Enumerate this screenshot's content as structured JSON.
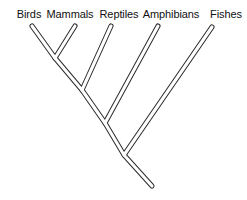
{
  "figure": {
    "name": "cladogram",
    "type": "phylogenetic-tree-diagram",
    "background_color": "#ffffff",
    "line_color": "#2b2b2b",
    "line_fill_color": "#ffffff",
    "label_color": "#111111"
  },
  "taxa": [
    {
      "id": "birds",
      "label": "Birds",
      "label_x": 29,
      "label_y": 8,
      "tip_x": 32,
      "tip_y": 26
    },
    {
      "id": "mammals",
      "label": "Mammals",
      "label_x": 70,
      "label_y": 8,
      "tip_x": 75,
      "tip_y": 26
    },
    {
      "id": "reptiles",
      "label": "Reptiles",
      "label_x": 119,
      "label_y": 8,
      "tip_x": 111,
      "tip_y": 26
    },
    {
      "id": "amphibians",
      "label": "Amphibians",
      "label_x": 171,
      "label_y": 8,
      "tip_x": 158,
      "tip_y": 26
    },
    {
      "id": "fishes",
      "label": "Fishes",
      "label_x": 226,
      "label_y": 8,
      "tip_x": 212,
      "tip_y": 27
    }
  ],
  "nodes": [
    {
      "id": "node-birds-mammals",
      "x": 55,
      "y": 58,
      "children": [
        "birds",
        "mammals"
      ]
    },
    {
      "id": "node-reptiles-clade",
      "x": 82,
      "y": 90,
      "children": [
        "node-birds-mammals",
        "reptiles"
      ]
    },
    {
      "id": "node-amphibians-clade",
      "x": 105,
      "y": 123,
      "children": [
        "node-reptiles-clade",
        "amphibians"
      ]
    },
    {
      "id": "node-root",
      "x": 124,
      "y": 155,
      "children": [
        "node-amphibians-clade",
        "fishes"
      ]
    }
  ],
  "root_stem": {
    "from_x": 124,
    "from_y": 155,
    "to_x": 152,
    "to_y": 186
  },
  "paths": {
    "clade_birds_mammals": "M 32 26 L 55 58 L 75 26",
    "clade_reptiles": "M 55 58 L 82 90 L 111 26",
    "clade_amphibians": "M 82 90 L 105 123 L 158 26",
    "clade_fishes": "M 105 123 L 124 155 L 212 27",
    "root_stem": "M 124 155 L 152 186"
  }
}
